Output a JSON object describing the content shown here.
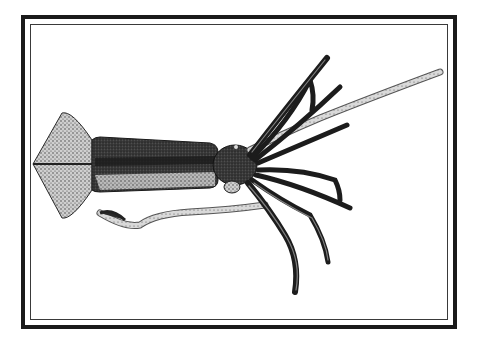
{
  "illustration": {
    "subject": "squid",
    "style": "stippled engraving",
    "orientation": "horizontal, head facing right",
    "colors": {
      "background": "#ffffff",
      "frame": "#1a1a1a",
      "ink_dark": "#1c1c1c",
      "ink_mid": "#5a5a5a",
      "ink_light": "#b8b8b8"
    }
  }
}
